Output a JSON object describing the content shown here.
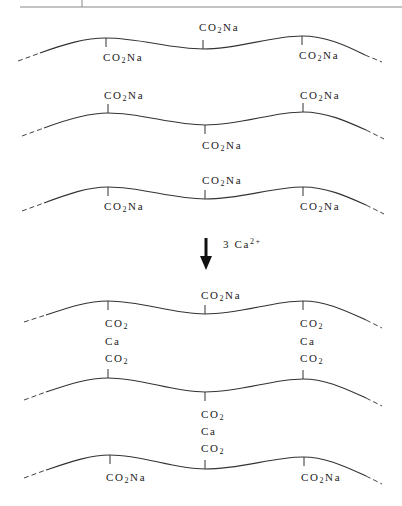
{
  "figure": {
    "before": {
      "chains": [
        {
          "top_labels": [
            "CO₂Na"
          ],
          "bottom_labels": [
            "CO₂Na",
            "CO₂Na"
          ]
        },
        {
          "top_labels": [
            "CO₂Na",
            "CO₂Na"
          ],
          "bottom_labels": [
            "CO₂Na"
          ]
        },
        {
          "top_labels": [
            "CO₂Na"
          ],
          "bottom_labels": [
            "CO₂Na",
            "CO₂Na"
          ]
        }
      ]
    },
    "reaction": {
      "arrow": "down-arrow",
      "reagent_coefficient": "3",
      "reagent_symbol": "Ca",
      "reagent_charge": "2+"
    },
    "after": {
      "top_label": "CO₂Na",
      "bridges": [
        {
          "lines": [
            "CO₂",
            "Ca",
            "CO₂"
          ],
          "position": "left"
        },
        {
          "lines": [
            "CO₂",
            "Ca",
            "CO₂"
          ],
          "position": "right"
        },
        {
          "lines": [
            "CO₂",
            "Ca",
            "CO₂"
          ],
          "position": "center"
        }
      ],
      "bottom_labels": [
        "CO₂Na",
        "CO₂Na"
      ]
    },
    "label_parts": {
      "c": "C",
      "o": "O",
      "two": "2",
      "na": "Na",
      "ca": "Ca"
    }
  }
}
